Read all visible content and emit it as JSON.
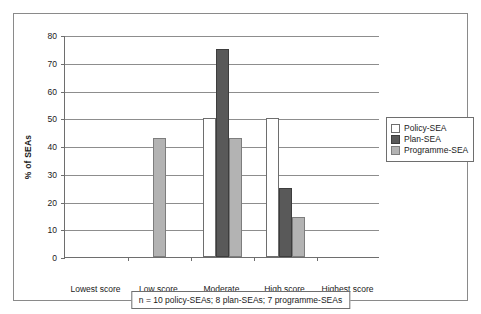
{
  "chart_data": {
    "type": "bar",
    "title": "",
    "xlabel": "",
    "ylabel": "% of SEAs",
    "ylim": [
      0,
      80
    ],
    "ytick_step": 10,
    "yticks": [
      0,
      10,
      20,
      30,
      40,
      50,
      60,
      70,
      80
    ],
    "grid": true,
    "legend_position": "right",
    "categories": [
      "Lowest score",
      "Low score",
      "Moderate score",
      "High score",
      "Highest score"
    ],
    "series": [
      {
        "name": "Policy-SEA",
        "color": "#ffffff",
        "values": [
          0,
          0,
          50,
          50,
          0
        ]
      },
      {
        "name": "Plan-SEA",
        "color": "#595959",
        "values": [
          0,
          0,
          75,
          25,
          0
        ]
      },
      {
        "name": "Programme-SEA",
        "color": "#b3b3b3",
        "values": [
          0,
          42.8,
          42.8,
          14.3,
          0
        ]
      }
    ],
    "annotation": "n = 10 policy-SEAs; 8 plan-SEAs; 7 programme-SEAs"
  },
  "axis": {
    "y_title": "% of SEAs",
    "y_ticks": [
      "0",
      "10",
      "20",
      "30",
      "40",
      "50",
      "60",
      "70",
      "80"
    ]
  },
  "categories": [
    {
      "line1": "Lowest score",
      "line2": ""
    },
    {
      "line1": "Low score",
      "line2": ""
    },
    {
      "line1": "Moderate",
      "line2": "score"
    },
    {
      "line1": "High score",
      "line2": ""
    },
    {
      "line1": "Highest score",
      "line2": ""
    }
  ],
  "legend": {
    "items": [
      {
        "label": "Policy-SEA"
      },
      {
        "label": "Plan-SEA"
      },
      {
        "label": "Programme-SEA"
      }
    ]
  },
  "footnote": {
    "text": "n = 10 policy-SEAs; 8 plan-SEAs; 7 programme-SEAs"
  }
}
